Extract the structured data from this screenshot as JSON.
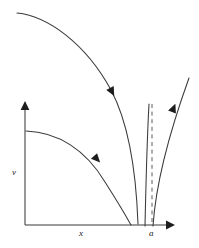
{
  "figure": {
    "background_color": "#ffffff",
    "line_color": "#3a3a3a",
    "arrow_color": "#1d1d1d",
    "dash_color": "#5a5a5a",
    "width": 199,
    "height": 248
  },
  "axes": {
    "y_axis": {
      "label": "v",
      "label_x": 12,
      "label_y": 175,
      "arrow_name": "y-axis-arrow"
    },
    "x_axis": {
      "label": "x",
      "label_x": 79,
      "label_y": 236,
      "arrow_name": "x-axis-arrow"
    },
    "origin_x": 25,
    "origin_y": 225,
    "x_axis_end": 174,
    "y_axis_top": 102
  },
  "markers": {
    "critical_point": {
      "label": "a",
      "label_x": 151,
      "label_y": 236
    }
  },
  "curves": [
    {
      "name": "upper-incoming-trajectory",
      "path": "M 17,13 C 48,16 86,44 111,90 C 127,120 136,168 138,224",
      "arrow_at": {
        "x": 110,
        "y": 88,
        "angle": 62
      }
    },
    {
      "name": "inner-incoming-trajectory",
      "path": "M 145,226 C 146,180 147,140 149,104",
      "arrow_at": null
    },
    {
      "name": "lower-incoming-trajectory",
      "path": "M 26,131 C 58,132 86,150 105,182 C 119,204 126,216 131,225",
      "arrow_at": {
        "x": 95,
        "y": 158,
        "angle": 45
      }
    },
    {
      "name": "outgoing-trajectory",
      "path": "M 153,226 C 155,196 163,150 189,78",
      "arrow_at": {
        "x": 172,
        "y": 111,
        "angle": -68
      }
    }
  ],
  "asymptote": {
    "name": "vertical-asymptote",
    "x": 152,
    "y_top": 104,
    "y_bottom": 226
  }
}
